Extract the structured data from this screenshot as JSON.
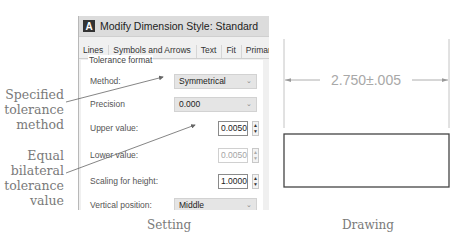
{
  "annotations": {
    "method_note": "Specified tolerance method",
    "value_note": "Equal bilateral tolerance value"
  },
  "dialog": {
    "title": "Modify Dimension Style: Standard",
    "app_icon": "A",
    "tabs": [
      "Lines",
      "Symbols and Arrows",
      "Text",
      "Fit",
      "Primary U"
    ],
    "group_label": "Tolerance format",
    "fields": {
      "method": {
        "label": "Method:",
        "value": "Symmetrical"
      },
      "precision": {
        "label": "Precision",
        "value": "0.000"
      },
      "upper": {
        "label": "Upper value:",
        "value": "0.0050"
      },
      "lower": {
        "label": "Lower value:",
        "value": "0.0050"
      },
      "scaling": {
        "label": "Scaling for height:",
        "value": "1.0000"
      },
      "vertical": {
        "label": "Vertical position:",
        "value": "Middle"
      }
    }
  },
  "drawing": {
    "dimension_text": "2.750±.005"
  },
  "captions": {
    "setting": "Setting",
    "drawing": "Drawing"
  }
}
